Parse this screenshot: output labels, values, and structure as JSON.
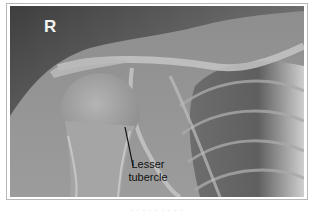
{
  "image": {
    "type": "radiograph",
    "view": "shoulder",
    "side_marker": "R",
    "annotation": {
      "line1": "Lesser",
      "line2": "tubercle"
    },
    "caption": "· · · ·   · · ·   · ·"
  }
}
